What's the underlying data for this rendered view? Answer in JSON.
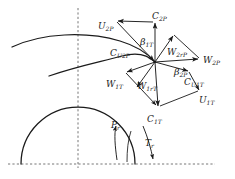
{
  "figure": {
    "type": "velocity-triangle-diagram",
    "title": "",
    "background_color": "#ffffff",
    "line_color": "#1a1a1a",
    "dash_color": "#555555"
  },
  "geometry": {
    "width": 235,
    "height": 179,
    "hub_junction": {
      "x": 155,
      "y": 62
    },
    "axis_origin": {
      "x": 78,
      "y": 164
    },
    "centerline_x": 78,
    "baseline_y": 164,
    "outer_arc": {
      "start_x": 12,
      "start_y": 47,
      "end_x": 155,
      "end_y": 62
    },
    "inner_arc": {
      "start_x": 49,
      "start_y": 76,
      "end_x": 155,
      "end_y": 62
    },
    "hub_circle": {
      "center_x": 78,
      "center_y": 164,
      "radius": 57
    }
  },
  "labels": {
    "u2p": {
      "base": "U",
      "sub": "2P",
      "x": 98,
      "y": 16
    },
    "c2p": {
      "base": "C",
      "sub": "2P",
      "x": 152,
      "y": 11
    },
    "cu2p": {
      "base": "C",
      "sub": "U2P",
      "x": 112,
      "y": 47
    },
    "beta1t": {
      "base": "β",
      "sub": "1T",
      "x": 141,
      "y": 36
    },
    "w2rp": {
      "base": "W",
      "sub": "2rP",
      "x": 168,
      "y": 45
    },
    "w2p": {
      "base": "W",
      "sub": "2P",
      "x": 203,
      "y": 53
    },
    "beta2p": {
      "base": "β",
      "sub": "2P",
      "x": 175,
      "y": 66
    },
    "cu1t": {
      "base": "C",
      "sub": "U1T",
      "x": 185,
      "y": 76
    },
    "u1t": {
      "base": "U",
      "sub": "1T",
      "x": 198,
      "y": 94
    },
    "w1t": {
      "base": "W",
      "sub": "1T",
      "x": 108,
      "y": 76
    },
    "w1rt": {
      "base": "W",
      "sub": "1rT",
      "x": 138,
      "y": 79
    },
    "c1t": {
      "base": "C",
      "sub": "1T",
      "x": 148,
      "y": 113
    },
    "pr": {
      "base": "P",
      "sub": "r",
      "x": 112,
      "y": 119
    },
    "tr": {
      "base": "T",
      "sub": "r",
      "x": 146,
      "y": 137
    }
  },
  "vectors": [
    {
      "name": "U2P",
      "from": "c2p-apex",
      "to": "u2p-tip",
      "arrow": true
    },
    {
      "name": "C2P",
      "from": "hub",
      "to": "c2p-apex",
      "arrow": true
    },
    {
      "name": "CU2P",
      "from": "u2p-tip",
      "to": "hub",
      "arrow": true
    },
    {
      "name": "W2rP",
      "from": "hub",
      "to": "w2rp-tip",
      "arrow": true
    },
    {
      "name": "W2P",
      "from": "hub",
      "to": "w2p-tip",
      "arrow": true
    },
    {
      "name": "CU1T",
      "from": "hub",
      "to": "cu1t-tip",
      "arrow": true
    },
    {
      "name": "U1T",
      "from": "c1t-apex",
      "to": "u1t-tip",
      "arrow": true
    },
    {
      "name": "W1T",
      "from": "hub",
      "to": "w1t-tip",
      "arrow": true
    },
    {
      "name": "W1rT",
      "from": "hub",
      "to": "w1rt-tip",
      "arrow": true
    },
    {
      "name": "C1T",
      "from": "hub",
      "to": "c1t-apex",
      "arrow": true
    },
    {
      "name": "W1T-close",
      "from": "w1t-tip",
      "to": "c1t-apex",
      "arrow": true
    },
    {
      "name": "Pr",
      "from": "pr-curve-start",
      "to": "pr-curve-end",
      "arrow": true
    },
    {
      "name": "Tr",
      "from": "tr-curve-start",
      "to": "tr-curve-end",
      "arrow": true
    }
  ]
}
